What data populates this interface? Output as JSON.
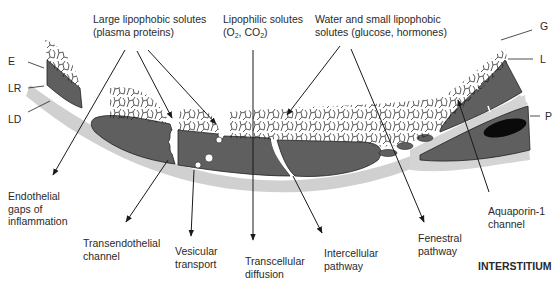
{
  "figure": {
    "type": "capillary wall transport pathways diagram",
    "region_label": "INTERSTITIUM"
  },
  "top_labels": {
    "large_solutes": {
      "line1": "Large lipophobic solutes",
      "line2": "(plasma proteins)"
    },
    "lipophilic": {
      "line1": "Lipophilic solutes",
      "line2_prefix": "(O",
      "sub1": "2",
      "mid": ", CO",
      "sub2": "2",
      "suffix": ")"
    },
    "water_small": {
      "line1": "Water and small lipophobic",
      "line2": "solutes (glucose, hormones)"
    }
  },
  "layer_labels": {
    "left": [
      "E",
      "LR",
      "LD"
    ],
    "right": [
      "G",
      "L",
      "P"
    ]
  },
  "pathway_labels": {
    "endothelial_gaps": [
      "Endothelial",
      "gaps of",
      "inflammation"
    ],
    "transendothelial": [
      "Transendothelial",
      "channel"
    ],
    "vesicular": [
      "Vesicular",
      "transport"
    ],
    "transcellular": [
      "Transcellular",
      "diffusion"
    ],
    "intercellular": [
      "Intercellular",
      "pathway"
    ],
    "fenestral": [
      "Fenestral",
      "pathway"
    ],
    "aquaporin": [
      "Aquaporin-1",
      "channel"
    ]
  },
  "colors": {
    "cell": "#5f5f5f",
    "basement": "#d0d0d0",
    "glycocalyx": "#1a1a1a",
    "pericyte_nucleus": "#0a0a0a",
    "arrow": "#1a1a1a"
  }
}
